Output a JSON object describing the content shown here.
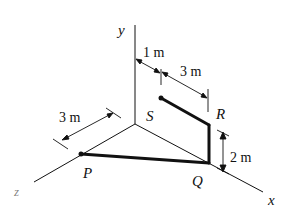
{
  "figure": {
    "axes": {
      "x_label": "x",
      "y_label": "y",
      "z_label": "z"
    },
    "points": {
      "P": "P",
      "Q": "Q",
      "R": "R",
      "S": "S"
    },
    "dimensions": {
      "y_to_S_offset": "1 m",
      "S_to_R_length": "3 m",
      "R_height": "2 m",
      "origin_to_P": "3 m"
    },
    "colors": {
      "line": "#111111",
      "background": "#ffffff"
    }
  }
}
